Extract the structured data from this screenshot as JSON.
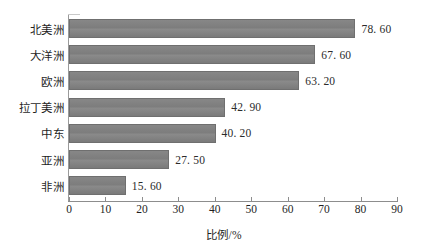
{
  "chart_data": {
    "type": "bar",
    "orientation": "horizontal",
    "title": "",
    "xlabel": "比例/%",
    "ylabel": "",
    "xlim": [
      0,
      90
    ],
    "xticks": [
      0,
      10,
      20,
      30,
      40,
      50,
      60,
      70,
      80,
      90
    ],
    "xtick_labels": [
      "0",
      "10",
      "20",
      "30",
      "40",
      "50",
      "60",
      "70",
      "80",
      "90"
    ],
    "grid": false,
    "legend": null,
    "categories": [
      "北美洲",
      "大洋洲",
      "欧洲",
      "拉丁美洲",
      "中东",
      "亚洲",
      "非洲"
    ],
    "values": [
      78.6,
      67.6,
      63.2,
      42.9,
      40.2,
      27.5,
      15.6
    ],
    "value_labels": [
      "78. 60",
      "67. 60",
      "63. 20",
      "42. 90",
      "40. 20",
      "27. 50",
      "15. 60"
    ],
    "bars": [
      {
        "category": "北美洲",
        "value": 78.6,
        "label": "78. 60"
      },
      {
        "category": "大洋洲",
        "value": 67.6,
        "label": "67. 60"
      },
      {
        "category": "欧洲",
        "value": 63.2,
        "label": "63. 20"
      },
      {
        "category": "拉丁美洲",
        "value": 42.9,
        "label": "42. 90"
      },
      {
        "category": "中东",
        "value": 40.2,
        "label": "40. 20"
      },
      {
        "category": "亚洲",
        "value": 27.5,
        "label": "27. 50"
      },
      {
        "category": "非洲",
        "value": 15.6,
        "label": "15. 60"
      }
    ],
    "colors": {
      "bar_fill": "#808080",
      "bar_edge": "#6f6f6f",
      "axis": "#8d8d8d",
      "text": "#1f1f1f",
      "background": "#ffffff"
    }
  }
}
